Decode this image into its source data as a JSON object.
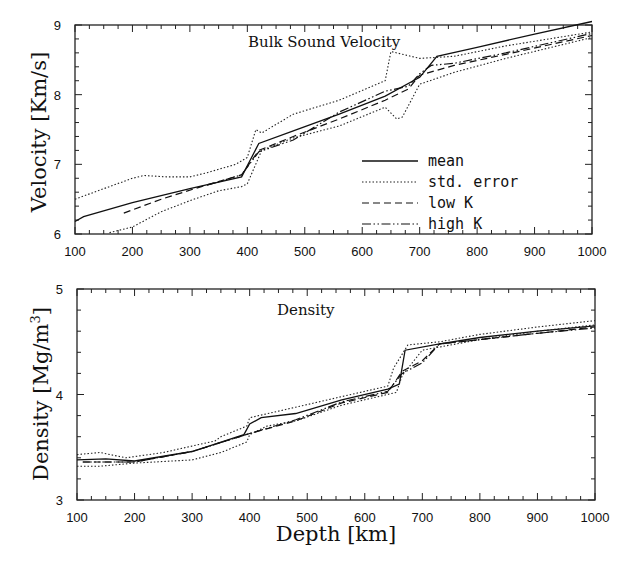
{
  "chart_data": [
    {
      "type": "line",
      "title": "Bulk Sound Velocity",
      "xlabel": "",
      "ylabel": "Velocity [Km/s]",
      "xlim": [
        100,
        1000
      ],
      "ylim": [
        6,
        9
      ],
      "xticks": [
        100,
        200,
        300,
        400,
        500,
        600,
        700,
        800,
        900,
        1000
      ],
      "yticks": [
        6,
        7,
        8,
        9
      ],
      "grid": false,
      "legend_position": "lower right (inside)",
      "legend": [
        "mean",
        "std. error",
        "low K",
        "high K"
      ],
      "series": [
        {
          "name": "mean",
          "style": "solid",
          "x": [
            100,
            115,
            200,
            300,
            390,
            420,
            480,
            560,
            640,
            700,
            730,
            800,
            900,
            1000
          ],
          "y": [
            6.18,
            6.25,
            6.45,
            6.65,
            6.82,
            7.3,
            7.48,
            7.72,
            7.98,
            8.25,
            8.55,
            8.68,
            8.87,
            9.05
          ]
        },
        {
          "name": "std. error (upper)",
          "style": "dotted",
          "x": [
            100,
            150,
            200,
            220,
            260,
            300,
            330,
            380,
            400,
            415,
            425,
            480,
            560,
            640,
            650,
            700,
            760,
            850,
            1000
          ],
          "y": [
            6.5,
            6.65,
            6.8,
            6.84,
            6.82,
            6.82,
            6.88,
            7.0,
            7.1,
            7.5,
            7.45,
            7.72,
            7.92,
            8.2,
            8.62,
            8.52,
            8.55,
            8.7,
            8.9
          ]
        },
        {
          "name": "std. error (lower)",
          "style": "dotted",
          "x": [
            160,
            200,
            250,
            300,
            350,
            390,
            400,
            425,
            480,
            560,
            640,
            660,
            670,
            700,
            760,
            850,
            1000
          ],
          "y": [
            6.02,
            6.1,
            6.32,
            6.48,
            6.62,
            6.68,
            6.72,
            7.2,
            7.38,
            7.55,
            7.82,
            7.65,
            7.68,
            8.15,
            8.32,
            8.52,
            8.82
          ]
        },
        {
          "name": "low K",
          "style": "dashed",
          "x": [
            185,
            250,
            320,
            390,
            420,
            480,
            560,
            640,
            680,
            700,
            760,
            850,
            1000
          ],
          "y": [
            6.3,
            6.5,
            6.68,
            6.85,
            7.2,
            7.4,
            7.65,
            7.92,
            8.08,
            8.28,
            8.42,
            8.58,
            8.85
          ]
        },
        {
          "name": "high K",
          "style": "dash-dot",
          "x": [
            330,
            390,
            420,
            480,
            560,
            640,
            680,
            700,
            720,
            760,
            850,
            1000
          ],
          "y": [
            6.7,
            6.85,
            7.18,
            7.35,
            7.75,
            8.05,
            8.12,
            8.3,
            8.42,
            8.45,
            8.6,
            8.88
          ]
        }
      ]
    },
    {
      "type": "line",
      "title": "Density",
      "xlabel": "Depth [km]",
      "ylabel": "Density [Mg/m³]",
      "xlim": [
        100,
        1000
      ],
      "ylim": [
        3,
        5
      ],
      "xticks": [
        100,
        200,
        300,
        400,
        500,
        600,
        700,
        800,
        900,
        1000
      ],
      "yticks": [
        3,
        4,
        5
      ],
      "grid": false,
      "series": [
        {
          "name": "mean",
          "style": "solid",
          "x": [
            100,
            150,
            200,
            300,
            390,
            400,
            420,
            480,
            560,
            640,
            660,
            670,
            730,
            800,
            900,
            1000
          ],
          "y": [
            3.38,
            3.39,
            3.37,
            3.46,
            3.62,
            3.72,
            3.78,
            3.82,
            3.95,
            4.05,
            4.1,
            4.42,
            4.48,
            4.54,
            4.6,
            4.65
          ]
        },
        {
          "name": "std. error (upper)",
          "style": "dotted",
          "x": [
            100,
            140,
            185,
            250,
            340,
            350,
            395,
            400,
            480,
            560,
            640,
            650,
            675,
            730,
            800,
            900,
            1000
          ],
          "y": [
            3.43,
            3.45,
            3.4,
            3.45,
            3.56,
            3.6,
            3.7,
            3.78,
            3.88,
            3.98,
            4.08,
            4.25,
            4.47,
            4.5,
            4.57,
            4.64,
            4.7
          ]
        },
        {
          "name": "std. error (lower)",
          "style": "dotted",
          "x": [
            100,
            140,
            200,
            300,
            350,
            395,
            400,
            430,
            480,
            560,
            655,
            665,
            700,
            800,
            900,
            1000
          ],
          "y": [
            3.32,
            3.32,
            3.35,
            3.38,
            3.45,
            3.55,
            3.62,
            3.7,
            3.75,
            3.9,
            4.02,
            4.18,
            4.42,
            4.52,
            4.6,
            4.66
          ]
        },
        {
          "name": "low K",
          "style": "dashed",
          "x": [
            110,
            200,
            300,
            400,
            480,
            560,
            640,
            665,
            700,
            730,
            800,
            900,
            1000
          ],
          "y": [
            3.36,
            3.36,
            3.46,
            3.63,
            3.75,
            3.92,
            4.02,
            4.22,
            4.32,
            4.48,
            4.52,
            4.58,
            4.64
          ]
        },
        {
          "name": "high K",
          "style": "dash-dot",
          "x": [
            110,
            200,
            300,
            400,
            480,
            560,
            640,
            665,
            700,
            730,
            800,
            900,
            1000
          ],
          "y": [
            3.36,
            3.36,
            3.46,
            3.63,
            3.76,
            3.93,
            4.03,
            4.2,
            4.3,
            4.48,
            4.52,
            4.58,
            4.63
          ]
        }
      ]
    }
  ],
  "panels": {
    "top": {
      "title": "Bulk Sound Velocity",
      "ylabel": "Velocity [Km/s]"
    },
    "bottom": {
      "title": "Density",
      "ylabel_main": "Density [Mg/m",
      "ylabel_sup": "3",
      "ylabel_end": "]"
    }
  },
  "xlabel": "Depth [km]",
  "legend": {
    "items": [
      {
        "label": "mean",
        "style": "solid"
      },
      {
        "label": "std. error",
        "style": "dotted"
      },
      {
        "label": "low K",
        "style": "dashed"
      },
      {
        "label": "high K",
        "style": "dash-dot"
      }
    ]
  }
}
